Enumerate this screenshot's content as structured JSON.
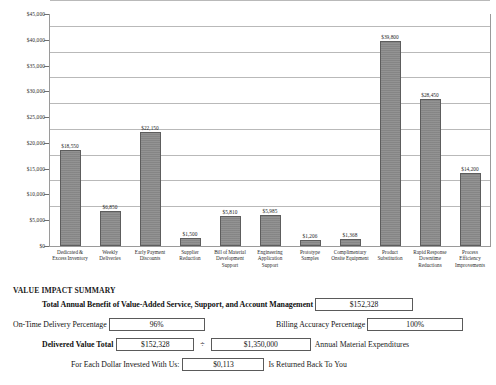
{
  "chart_data": {
    "type": "bar",
    "title": "",
    "xlabel": "",
    "ylabel": "",
    "ylim": [
      0,
      45000
    ],
    "ytick_labels": [
      "$45,000",
      "$40,000",
      "$35,000",
      "$30,000",
      "$25,000",
      "$20,000",
      "$15,000",
      "$10,000",
      "$5,000",
      "$0"
    ],
    "ytick_values": [
      45000,
      40000,
      35000,
      30000,
      25000,
      20000,
      15000,
      10000,
      5000,
      0
    ],
    "grid": true,
    "legend": "none",
    "categories": [
      "Dedicated & Excess Inventory",
      "Weekly Deliveries",
      "Early Payment Discounts",
      "Supplier Reduction",
      "Bill of Material Development Support",
      "Engineering Application Support",
      "Prototype Samples",
      "Complimentary Onsite Equipment",
      "Product Substitution",
      "Rapid Response Downtime Reductions",
      "Process Efficiency Improvements"
    ],
    "values": [
      18550,
      6850,
      22150,
      1500,
      5810,
      5985,
      1206,
      1368,
      39800,
      28450,
      14200
    ],
    "value_labels": [
      "$18,550",
      "$6,850",
      "$22,150",
      "$1,500",
      "$5,810",
      "$5,985",
      "$1,206",
      "$1,368",
      "$39,800",
      "$28,450",
      "$14,200"
    ],
    "bar_color": "#8d8d8d",
    "bar_border_color": "#5d5d5d"
  },
  "summary": {
    "title": "VALUE IMPACT SUMMARY",
    "total_benefit": {
      "label": "Total Annual Benefit of Value-Added Service, Support, and Account Management",
      "value": "$152,328"
    },
    "on_time_delivery": {
      "label": "On-Time Delivery Percentage",
      "value": "96%"
    },
    "billing_accuracy": {
      "label": "Billing Accuracy Percentage",
      "value": "100%"
    },
    "delivered_value": {
      "label": "Delivered Value Total",
      "value": "$152,328",
      "operator": "÷",
      "denominator": "$1,350,000",
      "trailing_label": "Annual Material Expenditures"
    },
    "dollar_return": {
      "label": "For Each Dollar Invested With Us:",
      "value": "$0,113",
      "trailing_label": "Is Returned Back To You"
    }
  }
}
